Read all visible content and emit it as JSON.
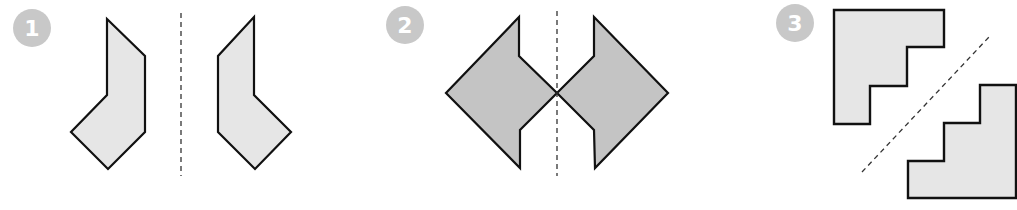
{
  "colors": {
    "badge": "#c8c8c8",
    "badge_text": "#ffffff",
    "shape_fill_light": "#e6e6e6",
    "shape_fill_dark": "#c4c4c4",
    "stroke": "#111111",
    "axis": "#333333"
  },
  "panels": [
    {
      "number": "1",
      "description": "Two bent hexagonal shapes reflected across a vertical dashed line",
      "axis": "vertical"
    },
    {
      "number": "2",
      "description": "Two arrow-like shapes touching at a point, reflected across a vertical dashed line",
      "axis": "vertical"
    },
    {
      "number": "3",
      "description": "Two staircase shapes reflected across a diagonal dashed line",
      "axis": "diagonal"
    }
  ]
}
